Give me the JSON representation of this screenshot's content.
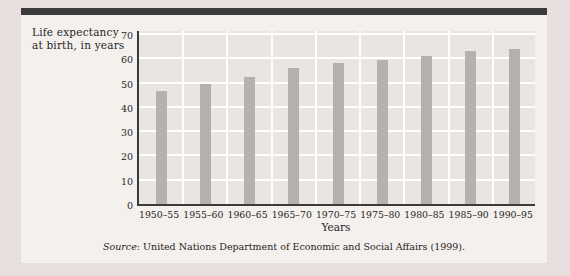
{
  "figure": {
    "ylabel_line1": "Life expectancy",
    "ylabel_line2": "at birth, in years",
    "source_label": "Source",
    "source_rest": ": United Nations Department of Economic and Social Affairs (1999)."
  },
  "colors": {
    "page_bg": "#e7dfdd",
    "panel_bg": "#f4f0ed",
    "plot_bg": "#e9e6e2",
    "gridline": "#ffffff",
    "bar": "#b3b2b0",
    "axis": "#3c3c3c",
    "top_rule": "#3b3b3b",
    "text": "#1f1f1f"
  },
  "chart_data": {
    "type": "bar",
    "title": "Life expectancy at birth, in years",
    "categories": [
      "1950–55",
      "1955–60",
      "1960–65",
      "1965–70",
      "1970–75",
      "1975–80",
      "1980–85",
      "1985–90",
      "1990–95"
    ],
    "values": [
      46.5,
      49.5,
      52.5,
      56,
      58,
      59.5,
      61,
      63,
      64
    ],
    "xlabel": "Years",
    "ylabel": "Life expectancy at birth, in years",
    "ylim": [
      0,
      70
    ],
    "yticks": [
      0,
      10,
      20,
      30,
      40,
      50,
      60,
      70
    ],
    "grid": true,
    "legend": false
  }
}
